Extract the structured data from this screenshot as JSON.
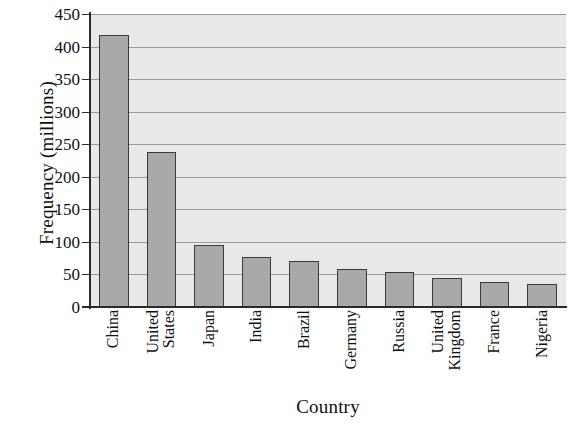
{
  "chart_data": {
    "type": "bar",
    "title": "",
    "xlabel": "Country",
    "ylabel": "Frequency (millions)",
    "categories": [
      "China",
      "United States",
      "Japan",
      "India",
      "Brazil",
      "Germany",
      "Russia",
      "United Kingdom",
      "France",
      "Nigeria"
    ],
    "category_lines": [
      [
        "China"
      ],
      [
        "United",
        "States"
      ],
      [
        "Japan"
      ],
      [
        "India"
      ],
      [
        "Brazil"
      ],
      [
        "Germany"
      ],
      [
        "Russia"
      ],
      [
        "United",
        "Kingdom"
      ],
      [
        "France"
      ],
      [
        "Nigeria"
      ]
    ],
    "values": [
      418,
      238,
      96,
      77,
      71,
      59,
      54,
      45,
      38,
      36
    ],
    "ylim": [
      0,
      450
    ],
    "ytick_values": [
      0,
      50,
      100,
      150,
      200,
      250,
      300,
      350,
      400,
      450
    ],
    "ytick_labels": [
      "0",
      "50",
      "100",
      "150",
      "200",
      "250",
      "300",
      "350",
      "400",
      "450"
    ],
    "grid": true,
    "legend": "none",
    "colors": {
      "bar_fill": "#a9a9a9",
      "bar_edge": "#3a3a3a",
      "plot_background": "#e9e9e9",
      "gridline": "#9a9a9a",
      "axis": "#2a2a2a",
      "text": "#111111",
      "page_background": "#ffffff"
    }
  }
}
